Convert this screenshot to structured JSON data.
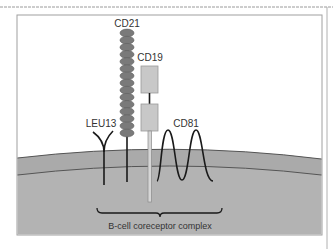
{
  "figure": {
    "title": "B-cell coreceptor complex",
    "colors": {
      "cell_fill": "#b3b3b3",
      "membrane_fill": "#a9a9a9",
      "membrane_line": "#555555",
      "cd21_domain": "#7a7a7a",
      "cd19_box": "#c8c8c8",
      "stroke": "#1a1a1a",
      "frame": "#9a9a9a"
    },
    "components": [
      {
        "id": "leu13",
        "label": "LEU13",
        "shape": "Y-shaped transmembrane protein"
      },
      {
        "id": "cd21",
        "label": "CD21",
        "shape": "stack of repeated oval domains",
        "domain_count": 15
      },
      {
        "id": "cd19",
        "label": "CD19",
        "shape": "two rectangular extracellular domains with long cytoplasmic tail"
      },
      {
        "id": "cd81",
        "label": "CD81",
        "shape": "multi-pass transmembrane protein (two loops)"
      }
    ],
    "bracket_label": "B-cell coreceptor complex"
  }
}
